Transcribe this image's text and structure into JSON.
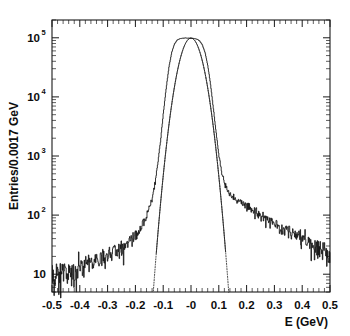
{
  "chart_data": {
    "type": "line",
    "title": "",
    "subtitle": "",
    "xlabel": "E (GeV)",
    "ylabel": "Entries/0.0017 GeV",
    "xlim": [
      -0.5,
      0.5
    ],
    "ylim": [
      5,
      200000
    ],
    "yscale": "log",
    "xscale": "linear",
    "grid": false,
    "legend": "none",
    "bin_width": 0.0017,
    "x_ticks": [
      "-0.5",
      "-0.4",
      "-0.3",
      "-0.2",
      "-0.1",
      "-0",
      "0.1",
      "0.2",
      "0.3",
      "0.4",
      "0.5"
    ],
    "x_tick_values": [
      -0.5,
      -0.4,
      -0.3,
      -0.2,
      -0.1,
      0,
      0.1,
      0.2,
      0.3,
      0.4,
      0.5
    ],
    "y_ticks": [
      "10",
      "10^2",
      "10^3",
      "10^4",
      "10^5"
    ],
    "y_tick_values": [
      10,
      100,
      1000,
      10000,
      100000
    ],
    "y_tick_display": [
      {
        "base": "10",
        "sup": ""
      },
      {
        "base": "10",
        "sup": "2"
      },
      {
        "base": "10",
        "sup": "3"
      },
      {
        "base": "10",
        "sup": "4"
      },
      {
        "base": "10",
        "sup": "5"
      }
    ],
    "series": [
      {
        "name": "data histogram",
        "style": "solid-noisy",
        "color": "#111111",
        "peak_value": 98000,
        "peak_x": 0.0,
        "description": "Measured energy residual distribution with non-Gaussian tails",
        "x": [
          -0.5,
          -0.49,
          -0.48,
          -0.47,
          -0.46,
          -0.45,
          -0.44,
          -0.43,
          -0.42,
          -0.41,
          -0.4,
          -0.39,
          -0.38,
          -0.37,
          -0.36,
          -0.35,
          -0.34,
          -0.33,
          -0.32,
          -0.31,
          -0.3,
          -0.29,
          -0.28,
          -0.27,
          -0.26,
          -0.25,
          -0.24,
          -0.23,
          -0.22,
          -0.21,
          -0.2,
          -0.19,
          -0.18,
          -0.17,
          -0.16,
          -0.15,
          -0.14,
          -0.13,
          -0.12,
          -0.11,
          -0.1,
          -0.09,
          -0.08,
          -0.07,
          -0.06,
          -0.05,
          -0.04,
          -0.03,
          -0.02,
          -0.01,
          0.0,
          0.01,
          0.02,
          0.03,
          0.04,
          0.05,
          0.06,
          0.07,
          0.08,
          0.09,
          0.1,
          0.11,
          0.12,
          0.13,
          0.14,
          0.15,
          0.16,
          0.17,
          0.18,
          0.19,
          0.2,
          0.21,
          0.22,
          0.23,
          0.24,
          0.25,
          0.26,
          0.27,
          0.28,
          0.29,
          0.3,
          0.31,
          0.32,
          0.33,
          0.34,
          0.35,
          0.36,
          0.37,
          0.38,
          0.39,
          0.4,
          0.41,
          0.42,
          0.43,
          0.44,
          0.45,
          0.46,
          0.47,
          0.48,
          0.49,
          0.5
        ],
        "y": [
          9,
          8,
          11,
          7,
          10,
          12,
          9,
          13,
          11,
          10,
          14,
          12,
          15,
          13,
          16,
          14,
          18,
          16,
          20,
          18,
          22,
          21,
          25,
          24,
          28,
          27,
          32,
          31,
          37,
          38,
          46,
          52,
          62,
          75,
          95,
          130,
          200,
          360,
          760,
          1900,
          5400,
          14000,
          32000,
          57000,
          79000,
          92000,
          97000,
          98500,
          99000,
          98800,
          98000,
          97500,
          95000,
          89000,
          76000,
          56000,
          33000,
          15500,
          6200,
          2400,
          1000,
          520,
          340,
          265,
          225,
          200,
          185,
          172,
          160,
          150,
          142,
          133,
          125,
          118,
          110,
          103,
          96,
          90,
          84,
          79,
          74,
          69,
          65,
          61,
          57,
          54,
          50,
          47,
          44,
          41,
          39,
          36,
          34,
          32,
          30,
          29,
          27,
          26,
          25,
          24,
          23
        ]
      },
      {
        "name": "Gaussian fit",
        "style": "dotted",
        "color": "#3a3a3a",
        "description": "Single Gaussian fit to the core, falls off steeply beyond +/-0.15 GeV",
        "fit_mean": 0.0,
        "fit_sigma": 0.0305,
        "fit_amplitude": 99000,
        "visible_range": [
          -0.175,
          0.175
        ]
      }
    ],
    "annotations": []
  },
  "figure": {
    "background_color": "#ffffff",
    "frame_color": "#1a1a1a",
    "width": 350,
    "height": 336
  }
}
